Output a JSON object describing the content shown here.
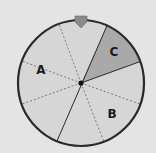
{
  "figure": {
    "type": "spinner",
    "sections": [
      {
        "label": "A",
        "shade": "light"
      },
      {
        "label": "B",
        "shade": "light"
      },
      {
        "label": "C",
        "shade": "dark"
      }
    ],
    "colors": {
      "background": "#e4e4e4",
      "face": "#d6d6d6",
      "section_c": "#a9a9a9",
      "outline": "#2a2a2a",
      "pointer": "#8a8a8a",
      "dash": "#7a7a7a"
    }
  }
}
